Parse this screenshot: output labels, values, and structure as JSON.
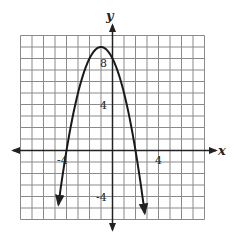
{
  "chart_data": {
    "type": "line",
    "title": "",
    "xlabel": "x",
    "ylabel": "y",
    "xlim": [
      -8,
      8
    ],
    "ylim": [
      -6,
      10
    ],
    "grid": true,
    "grid_step": 1,
    "x_tick_labels": [
      {
        "value": -4,
        "label": "-4"
      },
      {
        "value": 4,
        "label": "4"
      }
    ],
    "y_tick_labels": [
      {
        "value": 8,
        "label": "8"
      },
      {
        "value": 4,
        "label": "4"
      },
      {
        "value": -4,
        "label": "-4"
      }
    ],
    "series": [
      {
        "name": "parabola",
        "equation": "y = -(x+4)(x-2)",
        "vertex": [
          -1,
          9
        ],
        "roots": [
          -4,
          2
        ],
        "y_intercept": 8,
        "x_range": [
          -4.7,
          2.8
        ],
        "arrows_at_ends": true
      }
    ],
    "legend": null
  },
  "labels": {
    "x_axis": "x",
    "y_axis": "y",
    "tick_x_neg4": "-4",
    "tick_x_4": "4",
    "tick_y_8": "8",
    "tick_y_4": "4",
    "tick_y_neg4": "-4"
  },
  "colors": {
    "grid": "#8a8a8a",
    "axis": "#222222",
    "curve": "#1a1a1a"
  }
}
